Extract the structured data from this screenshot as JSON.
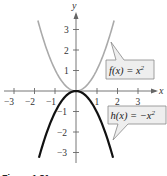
{
  "chart_data": {
    "type": "line",
    "title": "",
    "xlabel": "x",
    "ylabel": "y",
    "xlim": [
      -3.5,
      3.6
    ],
    "ylim": [
      -3.5,
      3.8
    ],
    "x_ticks": [
      -3,
      -2,
      -1,
      1,
      2,
      3
    ],
    "x_tick_labels": [
      "−3",
      "−2",
      "−1",
      "1",
      "2",
      "3"
    ],
    "y_ticks": [
      3,
      2,
      1,
      -1,
      -2,
      -3
    ],
    "y_tick_labels": [
      "3",
      "2",
      "1",
      "−1",
      "−2",
      "−3"
    ],
    "grid": false,
    "series": [
      {
        "name": "f(x) = x²",
        "expression": "x^2",
        "color": "#aaaaaa",
        "x_range": [
          -1.85,
          1.85
        ],
        "points": [
          [
            -1.8,
            3.24
          ],
          [
            -1.5,
            2.25
          ],
          [
            -1,
            1
          ],
          [
            -0.5,
            0.25
          ],
          [
            0,
            0
          ],
          [
            0.5,
            0.25
          ],
          [
            1,
            1
          ],
          [
            1.5,
            2.25
          ],
          [
            1.8,
            3.24
          ]
        ]
      },
      {
        "name": "h(x) = −x²",
        "expression": "-x^2",
        "color": "#111111",
        "x_range": [
          -1.8,
          1.8
        ],
        "points": [
          [
            -1.8,
            -3.24
          ],
          [
            -1.5,
            -2.25
          ],
          [
            -1,
            -1
          ],
          [
            -0.5,
            -0.25
          ],
          [
            0,
            0
          ],
          [
            0.5,
            -0.25
          ],
          [
            1,
            -1
          ],
          [
            1.5,
            -2.25
          ],
          [
            1.8,
            -3.24
          ]
        ]
      }
    ],
    "annotations": [
      {
        "text": "f(x) = x²",
        "points_to": "f curve near x≈1.6"
      },
      {
        "text": "h(x) = −x²",
        "points_to": "h curve near x≈1.7"
      }
    ],
    "legend_position": "callout labels at right"
  },
  "labels": {
    "x_axis": "x",
    "y_axis": "y",
    "f_label_main": "f(x) = x",
    "f_label_sup": "2",
    "h_label_main": "h(x) = −x",
    "h_label_sup": "2",
    "caption": "Figure 1.81"
  },
  "colors": {
    "f_curve": "#aaaaaa",
    "h_curve": "#111111",
    "axis": "#666666",
    "callout_fill": "#eeeeee",
    "callout_border": "#888888"
  }
}
